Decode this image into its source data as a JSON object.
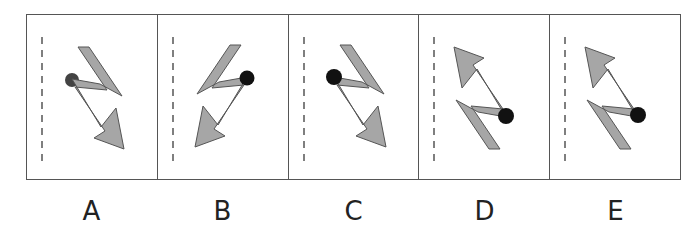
{
  "figure": {
    "type": "visual-reasoning-options",
    "panels": [
      {
        "label": "A",
        "transform": "none",
        "dot": {
          "cx": 45,
          "cy": 65,
          "style": "faded"
        }
      },
      {
        "label": "B",
        "transform": "mirror-horizontal",
        "dot": {
          "cx": 89,
          "cy": 63,
          "style": "solid"
        }
      },
      {
        "label": "C",
        "transform": "none",
        "dot": {
          "cx": 45,
          "cy": 62,
          "style": "solid"
        }
      },
      {
        "label": "D",
        "transform": "rotate-180",
        "dot": {
          "cx": 87,
          "cy": 101,
          "style": "solid"
        }
      },
      {
        "label": "E",
        "transform": "rotate-180",
        "dot": {
          "cx": 88,
          "cy": 100,
          "style": "solid"
        }
      }
    ],
    "shape_fill": "#a6a6a6",
    "shape_stroke": "#555555",
    "dot_color": "#111111",
    "border_color": "#555555",
    "dashed_line_color": "#555555"
  }
}
